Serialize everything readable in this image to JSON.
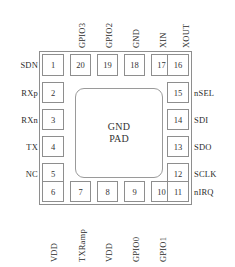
{
  "diagram": {
    "type": "ic-pinout",
    "package": "QFN-20",
    "center_pad": {
      "line1": "GND",
      "line2": "PAD"
    },
    "colors": {
      "outline": "#8e8e8e",
      "pad_outline": "#8e8e8e",
      "text": "#2b2b2b",
      "background": "#ffffff"
    },
    "top_pins": [
      {
        "number": "1",
        "label": ""
      },
      {
        "number": "20",
        "label": "GPIO3"
      },
      {
        "number": "19",
        "label": "GPIO2"
      },
      {
        "number": "18",
        "label": "GND"
      },
      {
        "number": "17",
        "label": "XIN"
      },
      {
        "number": "16",
        "label": "XOUT"
      }
    ],
    "left_pins": [
      {
        "number": "1",
        "label": "SDN"
      },
      {
        "number": "2",
        "label": "RXp"
      },
      {
        "number": "3",
        "label": "RXn"
      },
      {
        "number": "4",
        "label": "TX"
      },
      {
        "number": "5",
        "label": "NC"
      },
      {
        "number": "6",
        "label": ""
      }
    ],
    "right_pins": [
      {
        "number": "16",
        "label": ""
      },
      {
        "number": "15",
        "label": "nSEL"
      },
      {
        "number": "14",
        "label": "SDI"
      },
      {
        "number": "13",
        "label": "SDO"
      },
      {
        "number": "12",
        "label": "SCLK"
      },
      {
        "number": "11",
        "label": "nIRQ"
      }
    ],
    "bottom_pins": [
      {
        "number": "6",
        "label": "VDD"
      },
      {
        "number": "7",
        "label": "TXRamp"
      },
      {
        "number": "8",
        "label": "VDD"
      },
      {
        "number": "9",
        "label": "GPIO0"
      },
      {
        "number": "10",
        "label": "GPIO1"
      },
      {
        "number": "11",
        "label": ""
      }
    ]
  }
}
